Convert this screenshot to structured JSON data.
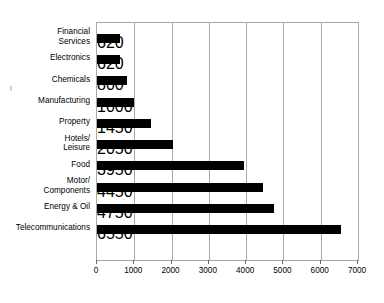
{
  "chart_data": {
    "type": "bar",
    "orientation": "horizontal",
    "title": "",
    "subtitle": "",
    "xlabel": "",
    "ylabel": "",
    "categories": [
      "Financial\nServices",
      "Electronics",
      "Chemicals",
      "Manufacturing",
      "Property",
      "Hotels/\nLeisure",
      "Food",
      "Motor/\nComponents",
      "Energy & Oil",
      "Telecommunications"
    ],
    "values": [
      620,
      620,
      800,
      1000,
      1450,
      2050,
      3950,
      4450,
      4750,
      6550
    ],
    "xlim": [
      0,
      7000
    ],
    "xticks": [
      0,
      1000,
      2000,
      3000,
      4000,
      5000,
      6000,
      7000
    ],
    "xtick_labels": [
      "0",
      "1000",
      "2000",
      "3000",
      "4000",
      "5000",
      "6000",
      "7000"
    ],
    "grid": "vertical",
    "legend": "none",
    "bar_color": "#000000",
    "grid_color": "#a8a8a8",
    "background_color": "#ffffff"
  },
  "axis": {
    "tick_labels": [
      "0",
      "1000",
      "2000",
      "3000",
      "4000",
      "5000",
      "6000",
      "7000"
    ]
  },
  "categories": [
    {
      "label": "Financial\nServices",
      "value": 620
    },
    {
      "label": "Electronics",
      "value": 620
    },
    {
      "label": "Chemicals",
      "value": 800
    },
    {
      "label": "Manufacturing",
      "value": 1000
    },
    {
      "label": "Property",
      "value": 1450
    },
    {
      "label": "Hotels/\nLeisure",
      "value": 2050
    },
    {
      "label": "Food",
      "value": 3950
    },
    {
      "label": "Motor/\nComponents",
      "value": 4450
    },
    {
      "label": "Energy & Oil",
      "value": 4750
    },
    {
      "label": "Telecommunications",
      "value": 6550
    }
  ]
}
